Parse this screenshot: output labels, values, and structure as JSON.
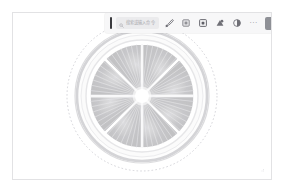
{
  "window": {
    "title": "Image Editor",
    "background_color": "#ffffff",
    "panel_border_color": "#e2e2e4"
  },
  "toolbar": {
    "background_color": "#f7f7f8",
    "caret_color": "#3b3b3f",
    "search": {
      "icon": "search-icon",
      "placeholder": "搜索或输入命令",
      "value": ""
    },
    "tools": [
      {
        "name": "brush-tool",
        "icon": "brush-icon",
        "label": "画笔",
        "active": false
      },
      {
        "name": "crop-tool",
        "icon": "crop-icon",
        "label": "裁剪",
        "active": false
      },
      {
        "name": "frame-tool",
        "icon": "frame-icon",
        "label": "边框",
        "active": false
      },
      {
        "name": "shape-tool",
        "icon": "shape-icon",
        "label": "形状",
        "active": false
      },
      {
        "name": "adjust-tool",
        "icon": "contrast-icon",
        "label": "调整",
        "active": false
      }
    ],
    "overflow": {
      "name": "more-options",
      "icon": "ellipsis-icon",
      "label": "···"
    },
    "action_button": {
      "label": "智能抠图",
      "background_color": "#8e9096",
      "text_color": "#ffffff"
    }
  },
  "canvas": {
    "background_color": "#ffffff",
    "selection": {
      "shape": "circle",
      "style": "dashed",
      "color": "#c9c9cf",
      "visible": true
    },
    "artwork": {
      "name": "lemon-slice",
      "description": "Grayscale citrus cross-section",
      "segments": 8,
      "colors": {
        "rind_outer": "#d7d7d9",
        "pith": "#fbfbfb",
        "segment_fill": "#c9c9cb",
        "segment_edge": "#ffffff",
        "fiber": "#e4e4e6",
        "core": "#ffffff"
      }
    }
  },
  "status": {
    "resize_handle": "resize-grip-icon"
  }
}
